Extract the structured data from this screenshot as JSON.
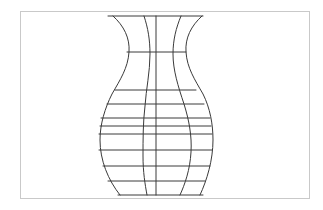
{
  "figure": {
    "frame": {
      "x": 20,
      "y": 11,
      "width": 290,
      "height": 188,
      "stroke": "#c9c9c9"
    },
    "line_color": "#3a3a3a",
    "rim": {
      "y": 16,
      "x1": 108,
      "x2": 203
    },
    "base": {
      "y": 195,
      "x1": 118,
      "x2": 203
    },
    "center_line": {
      "x": 156,
      "y1": 16,
      "y2": 195
    },
    "contours": [
      {
        "name": "outer-left",
        "d": "M113,16 C124,26 130,38 129,52 C128,68 120,80 112,94 C105,108 100,124 100,140 C100,160 108,180 120,195"
      },
      {
        "name": "outer-right",
        "d": "M202,16 C191,26 185,38 186,52 C187,68 195,80 203,94 C210,108 213,124 213,140 C213,160 207,180 200,195"
      },
      {
        "name": "inner-left",
        "d": "M144,16 C148,28 150,40 150,54 C150,72 146,90 145,106 C143,122 143,140 143,156 C143,172 145,184 147,195"
      },
      {
        "name": "inner-right",
        "d": "M181,16 C176,28 173,40 173,54 C173,70 178,86 184,104 C189,120 192,136 191,152 C190,170 185,184 180,195"
      }
    ],
    "horizontals": [
      {
        "y": 52,
        "x1": 127,
        "x2": 186
      },
      {
        "y": 90,
        "x1": 115,
        "x2": 196
      },
      {
        "y": 104,
        "x1": 107,
        "x2": 204
      },
      {
        "y": 118,
        "x1": 101,
        "x2": 210
      },
      {
        "y": 126,
        "x1": 100,
        "x2": 211
      },
      {
        "y": 134,
        "x1": 99,
        "x2": 212
      },
      {
        "y": 150,
        "x1": 99,
        "x2": 212
      },
      {
        "y": 166,
        "x1": 103,
        "x2": 210
      },
      {
        "y": 181,
        "x1": 108,
        "x2": 205
      }
    ]
  }
}
